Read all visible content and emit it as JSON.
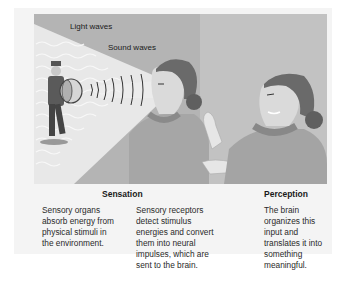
{
  "illustration": {
    "labels": {
      "light_waves": "Light waves",
      "sound_waves": "Sound waves"
    },
    "colors": {
      "background": "#b8b8b8",
      "right_background": "#c0c0c0",
      "light_beam": "#e6e6e6",
      "skin": "#dcdcdc",
      "hair": "#6a6a6a",
      "sweater": "#a8a8a8",
      "collar": "#8a8a8a"
    }
  },
  "sections": {
    "sensation": {
      "heading": "Sensation",
      "columns": [
        {
          "lines": [
            "Sensory organs",
            "absorb energy from",
            "physical stimuli in",
            "the environment."
          ]
        },
        {
          "lines": [
            "Sensory receptors",
            "detect stimulus",
            "energies and convert",
            "them into neural",
            "impulses, which are",
            "sent to the brain."
          ]
        }
      ]
    },
    "perception": {
      "heading": "Perception",
      "lines": [
        "The brain",
        "organizes this",
        "input and",
        "translates it into",
        "something",
        "meaningful."
      ]
    }
  }
}
